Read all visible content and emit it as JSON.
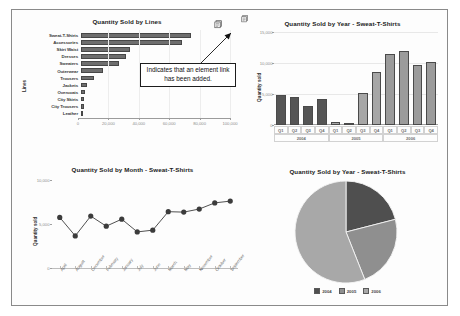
{
  "annotation": {
    "callout_text": "Indicates that an element link has been added.",
    "link_badge_icon": "element-link-badge-icon",
    "arrow_icon": "callout-arrow-icon"
  },
  "charts": {
    "lines": {
      "title": "Quantity Sold by Lines",
      "ylabel": "Lines",
      "xticks": [
        "0",
        "20,000",
        "40,000",
        "60,000",
        "80,000",
        "100,000"
      ]
    },
    "year_bars": {
      "title": "Quantity Sold by Year - Sweat-T-Shirts",
      "ylabel": "Quantity sold",
      "yticks": [
        "15,000",
        "10,000",
        "5,000",
        "0"
      ]
    },
    "month": {
      "title": "Quantity Sold by Month - Sweat-T-Shirts",
      "ylabel": "Quantity sold",
      "yticks": [
        "10,000",
        "5,000",
        "0"
      ]
    },
    "pie": {
      "title": "Quantity Sold by Year - Sweat-T-Shirts",
      "legend": [
        "2004",
        "2005",
        "2006"
      ]
    }
  },
  "chart_data": [
    {
      "id": "quantity-sold-by-lines",
      "type": "bar",
      "orientation": "horizontal",
      "title": "Quantity Sold by Lines",
      "xlabel": "",
      "ylabel": "Lines",
      "xlim": [
        0,
        100000
      ],
      "xticks": [
        0,
        20000,
        40000,
        60000,
        80000,
        100000
      ],
      "xticklabels": [
        "0",
        "20,000",
        "40,000",
        "60,000",
        "80,000",
        "100,000"
      ],
      "grid": true,
      "legend": "none",
      "categories": [
        "Sweat-T-Shirts",
        "Accessories",
        "Skirt Waist",
        "Dresses",
        "Sweaters",
        "Outerwear",
        "Trousers",
        "Jackets",
        "Overcoats",
        "City Skirts",
        "City Trousers",
        "Leather"
      ],
      "values": [
        74000,
        68000,
        33000,
        30500,
        25500,
        14500,
        8500,
        4200,
        2400,
        2100,
        1800,
        1200
      ]
    },
    {
      "id": "quantity-sold-by-year-bars",
      "type": "bar",
      "orientation": "vertical",
      "title": "Quantity Sold by Year - Sweat-T-Shirts",
      "xlabel": "",
      "ylabel": "Quantity sold",
      "ylim": [
        0,
        15000
      ],
      "yticks": [
        0,
        5000,
        10000,
        15000
      ],
      "yticklabels": [
        "0",
        "5,000",
        "10,000",
        "15,000"
      ],
      "grid": true,
      "legend": "none",
      "categories": [
        "Q1",
        "Q2",
        "Q3",
        "Q4",
        "Q1",
        "Q2",
        "Q3",
        "Q4",
        "Q1",
        "Q2",
        "Q3",
        "Q4"
      ],
      "group_labels": [
        "2004",
        "2005",
        "2006"
      ],
      "group_spans": [
        4,
        4,
        4
      ],
      "values": [
        4800,
        4500,
        3100,
        4200,
        500,
        120,
        5200,
        8600,
        11400,
        11900,
        9700,
        10100
      ]
    },
    {
      "id": "quantity-sold-by-month-line",
      "type": "line",
      "title": "Quantity Sold by Month - Sweat-T-Shirts",
      "xlabel": "",
      "ylabel": "Quantity sold",
      "ylim": [
        0,
        10000
      ],
      "yticks": [
        0,
        5000,
        10000
      ],
      "yticklabels": [
        "0",
        "5,000",
        "10,000"
      ],
      "grid": false,
      "legend": "none",
      "markers": true,
      "categories": [
        "April",
        "August",
        "December",
        "February",
        "January",
        "July",
        "June",
        "March",
        "May",
        "November",
        "October",
        "September"
      ],
      "values": [
        5750,
        3650,
        5900,
        4750,
        5550,
        4100,
        4300,
        6400,
        6350,
        6700,
        7400,
        7600
      ]
    },
    {
      "id": "quantity-sold-by-year-pie",
      "type": "pie",
      "title": "Quantity Sold by Year - Sweat-T-Shirts",
      "legend_position": "bottom",
      "labels": [
        "2004",
        "2005",
        "2006"
      ],
      "values": [
        21,
        23,
        56
      ],
      "colors": [
        "#4f4f4f",
        "#8f8f8f",
        "#a8a8a8"
      ]
    }
  ]
}
